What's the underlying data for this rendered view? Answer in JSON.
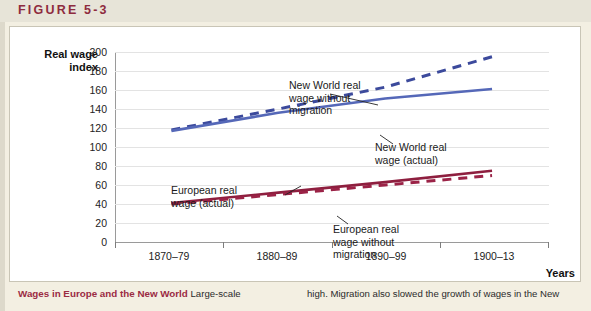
{
  "figure": {
    "label": "FIGURE 5-3",
    "accent_color": "#8e2b3e"
  },
  "caption": {
    "heading": "Wages in Europe and the New World",
    "left_text": "Large-scale",
    "right_text": "high. Migration also slowed the growth of wages in the New"
  },
  "chart_data": {
    "type": "line",
    "title": "",
    "xlabel": "Years",
    "ylabel": "Real wage index",
    "categories": [
      "1870–79",
      "1880–89",
      "1890–99",
      "1900–13"
    ],
    "ylim": [
      0,
      200
    ],
    "yticks": [
      0,
      20,
      40,
      60,
      80,
      100,
      120,
      140,
      160,
      180,
      200
    ],
    "grid": true,
    "legend_position": "inline-annotations",
    "series": [
      {
        "name": "New World real wage without migration",
        "style": "dashed",
        "color": "#3c4a9c",
        "values": [
          118,
          140,
          163,
          195
        ]
      },
      {
        "name": "New World real wage (actual)",
        "style": "solid",
        "color": "#5568b8",
        "values": [
          117,
          136,
          151,
          161
        ]
      },
      {
        "name": "European real wage (actual)",
        "style": "solid",
        "color": "#8e1f3f",
        "values": [
          41,
          52,
          63,
          75
        ]
      },
      {
        "name": "European real wage without migration",
        "style": "dashed",
        "color": "#9b2347",
        "values": [
          40,
          50,
          60,
          70
        ]
      }
    ],
    "annotations": [
      {
        "id": "nw-nomig",
        "text": "New World real wage without migration"
      },
      {
        "id": "nw-actual",
        "text": "New World real wage (actual)"
      },
      {
        "id": "eu-actual",
        "text": "European real wage (actual)"
      },
      {
        "id": "eu-nomig",
        "text": "European real wage without migration"
      }
    ]
  },
  "annotation_lines": {
    "nw_nomig_l1": "New World real",
    "nw_nomig_l2": "wage without",
    "nw_nomig_l3": "migration",
    "nw_actual_l1": "New World real",
    "nw_actual_l2": "wage (actual)",
    "eu_actual_l1": "European real",
    "eu_actual_l2": "wage (actual)",
    "eu_nomig_l1": "European real",
    "eu_nomig_l2": "wage without",
    "eu_nomig_l3": "migration"
  },
  "ylabel_lines": {
    "l1": "Real wage",
    "l2": "index"
  }
}
